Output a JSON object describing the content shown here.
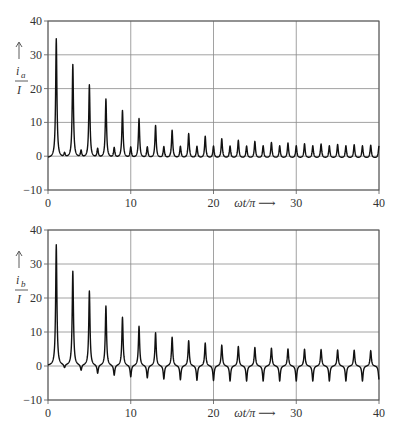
{
  "chart_data": [
    {
      "type": "line",
      "title": "",
      "xlabel": "ωt/π ⟶",
      "ylabel": "i_a / I",
      "ylabel_symbol": "i",
      "ylabel_sub": "a",
      "ylabel_den": "I",
      "xlim": [
        0,
        40
      ],
      "ylim": [
        -10,
        40
      ],
      "xticks": [
        0,
        10,
        20,
        30,
        40
      ],
      "yticks": [
        -10,
        0,
        10,
        20,
        30,
        40
      ],
      "grid": true,
      "legend": null,
      "series": [
        {
          "name": "i_a/I",
          "peaks_odd": {
            "x": [
              1,
              3,
              5,
              7,
              9,
              11,
              13,
              15,
              17,
              19,
              21,
              23,
              25,
              27,
              29,
              31,
              33,
              35,
              37,
              39
            ],
            "y": [
              34.7,
              27.0,
              21.0,
              16.8,
              13.4,
              11.0,
              9.0,
              7.6,
              6.6,
              5.8,
              5.1,
              4.6,
              4.3,
              4.0,
              3.8,
              3.6,
              3.5,
              3.4,
              3.3,
              3.2
            ]
          },
          "peaks_even": {
            "x": [
              2,
              4,
              6,
              8,
              10,
              12,
              14,
              16,
              18,
              20,
              22,
              24,
              26,
              28,
              30,
              32,
              34,
              36,
              38,
              40
            ],
            "y": [
              0.6,
              1.4,
              2.0,
              2.3,
              2.5,
              2.6,
              2.7,
              2.8,
              2.8,
              2.9,
              2.9,
              2.9,
              3.0,
              3.0,
              3.0,
              3.0,
              3.0,
              3.0,
              3.0,
              3.0
            ]
          },
          "baseline": -0.6
        }
      ]
    },
    {
      "type": "line",
      "title": "",
      "xlabel": "ωt/π ⟶",
      "ylabel": "i_b / I",
      "ylabel_symbol": "i",
      "ylabel_sub": "b",
      "ylabel_den": "I",
      "xlim": [
        0,
        40
      ],
      "ylim": [
        -10,
        40
      ],
      "xticks": [
        0,
        10,
        20,
        30,
        40
      ],
      "yticks": [
        -10,
        0,
        10,
        20,
        30,
        40
      ],
      "grid": true,
      "legend": null,
      "series": [
        {
          "name": "i_b/I",
          "peaks_odd": {
            "x": [
              1,
              3,
              5,
              7,
              9,
              11,
              13,
              15,
              17,
              19,
              21,
              23,
              25,
              27,
              29,
              31,
              33,
              35,
              37,
              39
            ],
            "y": [
              35.6,
              27.8,
              22.0,
              17.6,
              14.3,
              11.7,
              9.8,
              8.5,
              7.5,
              6.8,
              6.2,
              5.8,
              5.5,
              5.3,
              5.1,
              5.0,
              4.9,
              4.8,
              4.7,
              4.6
            ]
          },
          "peaks_even": {
            "x": [
              2,
              4,
              6,
              8,
              10,
              12,
              14,
              16,
              18,
              20,
              22,
              24,
              26,
              28,
              30,
              32,
              34,
              36,
              38,
              40
            ],
            "y": [
              -1.0,
              -1.7,
              -2.5,
              -3.0,
              -3.4,
              -3.7,
              -4.0,
              -4.2,
              -4.3,
              -4.4,
              -4.5,
              -4.5,
              -4.5,
              -4.5,
              -4.5,
              -4.5,
              -4.5,
              -4.5,
              -4.5,
              -4.0
            ]
          },
          "baseline": 0
        }
      ]
    }
  ]
}
